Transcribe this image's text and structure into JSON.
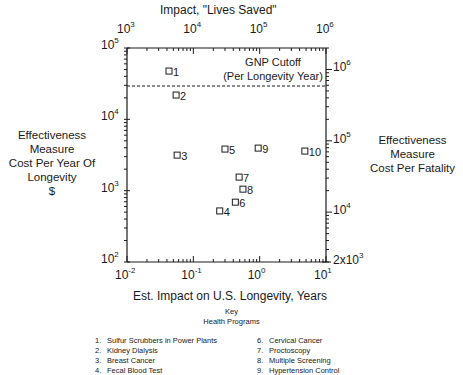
{
  "chart_data": {
    "type": "scatter",
    "title": "",
    "xlabel": "Est. Impact on U.S. Longevity, Years",
    "x2label": "Impact, \"Lives Saved\"",
    "ylabel": [
      "Effectiveness",
      "Measure",
      "Cost Per Year Of",
      "Longevity",
      "$"
    ],
    "y2label": [
      "Effectiveness",
      "Measure",
      "Cost Per Fatality"
    ],
    "xscale": "log",
    "yscale": "log",
    "xlim": [
      0.01,
      10
    ],
    "ylim": [
      100,
      100000
    ],
    "x2lim": [
      1000,
      1000000
    ],
    "y2lim": [
      2000,
      2000000
    ],
    "x_ticks": [
      {
        "base": "10",
        "exp": "-2"
      },
      {
        "base": "10",
        "exp": "-1"
      },
      {
        "base": "10",
        "exp": "0"
      },
      {
        "base": "10",
        "exp": "1"
      }
    ],
    "x2_ticks": [
      {
        "base": "10",
        "exp": "3"
      },
      {
        "base": "10",
        "exp": "4"
      },
      {
        "base": "10",
        "exp": "5"
      },
      {
        "base": "10",
        "exp": "6"
      }
    ],
    "y_ticks": [
      {
        "base": "10",
        "exp": "5"
      },
      {
        "base": "10",
        "exp": "4"
      },
      {
        "base": "10",
        "exp": "3"
      },
      {
        "base": "10",
        "exp": "2"
      }
    ],
    "y2_ticks": [
      {
        "base": "10",
        "exp": "6"
      },
      {
        "base": "10",
        "exp": "5"
      },
      {
        "base": "10",
        "exp": "4"
      },
      {
        "base": "2x10",
        "exp": "3"
      }
    ],
    "grid": false,
    "points": [
      {
        "label": "1",
        "x": 0.043,
        "y": 47500
      },
      {
        "label": "2",
        "x": 0.055,
        "y": 21900
      },
      {
        "label": "3",
        "x": 0.057,
        "y": 3150
      },
      {
        "label": "4",
        "x": 0.25,
        "y": 520
      },
      {
        "label": "5",
        "x": 0.3,
        "y": 3830
      },
      {
        "label": "6",
        "x": 0.43,
        "y": 690
      },
      {
        "label": "7",
        "x": 0.49,
        "y": 1550
      },
      {
        "label": "8",
        "x": 0.56,
        "y": 1050
      },
      {
        "label": "9",
        "x": 0.95,
        "y": 3950
      },
      {
        "label": "10",
        "x": 4.8,
        "y": 3590
      }
    ],
    "reference_line": {
      "type": "horizontal",
      "style": "dashed",
      "y": 29300,
      "label": [
        "GNP Cutoff",
        "(Per Longevity Year)"
      ]
    },
    "legend": {
      "title": [
        "Key",
        "Health Programs"
      ],
      "position": "bottom",
      "entries": [
        {
          "num": "1.",
          "label": "Sulfur Scrubbers in Power Plants"
        },
        {
          "num": "2.",
          "label": "Kidney Dialysis"
        },
        {
          "num": "3.",
          "label": "Breast Cancer"
        },
        {
          "num": "4.",
          "label": "Fecal Blood Test"
        },
        {
          "num": "6.",
          "label": "Cervical Cancer"
        },
        {
          "num": "7.",
          "label": "Proctoscopy"
        },
        {
          "num": "8.",
          "label": "Multiple Screening"
        },
        {
          "num": "9.",
          "label": "Hypertension Control"
        }
      ]
    }
  },
  "colors": {
    "ink": "#1a1a1a",
    "background": "#ffffff"
  }
}
